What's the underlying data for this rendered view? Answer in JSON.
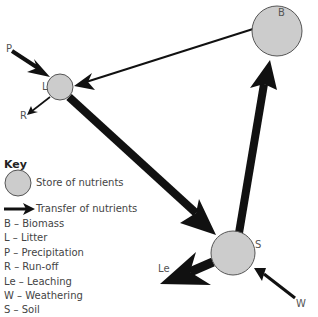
{
  "diagram": {
    "nodes": [
      {
        "id": "B",
        "label": "B",
        "name": "Biomass"
      },
      {
        "id": "L",
        "label": "L",
        "name": "Litter"
      },
      {
        "id": "S",
        "label": "S",
        "name": "Soil"
      }
    ],
    "flows": [
      {
        "from": "P",
        "to": "L",
        "label": "P"
      },
      {
        "from": "L",
        "to": "R",
        "label": "R"
      },
      {
        "from": "B",
        "to": "L"
      },
      {
        "from": "L",
        "to": "S"
      },
      {
        "from": "S",
        "to": "B"
      },
      {
        "from": "S",
        "to": "Le",
        "label": "Le"
      },
      {
        "from": "W",
        "to": "S",
        "label": "W"
      }
    ],
    "labels": {
      "B": "B",
      "L": "L",
      "S": "S",
      "P": "P",
      "R": "R",
      "Le": "Le",
      "W": "W"
    }
  },
  "key": {
    "title": "Key",
    "store": "Store of nutrients",
    "transfer": "Transfer of nutrients",
    "items": [
      "B – Biomass",
      "L – Litter",
      "P – Precipitation",
      "R – Run-off",
      "Le – Leaching",
      "W – Weathering",
      "S – Soil"
    ]
  },
  "colors": {
    "store_fill": "#cccccc",
    "store_stroke": "#555555",
    "arrow": "#111111"
  }
}
